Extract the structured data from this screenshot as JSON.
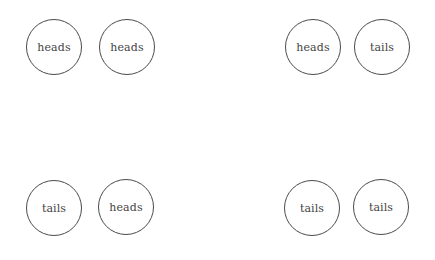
{
  "pairs": [
    {
      "coins": [
        {
          "label": "heads"
        },
        {
          "label": "heads"
        }
      ]
    },
    {
      "coins": [
        {
          "label": "heads"
        },
        {
          "label": "tails"
        }
      ]
    },
    {
      "coins": [
        {
          "label": "tails"
        },
        {
          "label": "heads"
        }
      ]
    },
    {
      "coins": [
        {
          "label": "tails"
        },
        {
          "label": "tails"
        }
      ]
    }
  ]
}
